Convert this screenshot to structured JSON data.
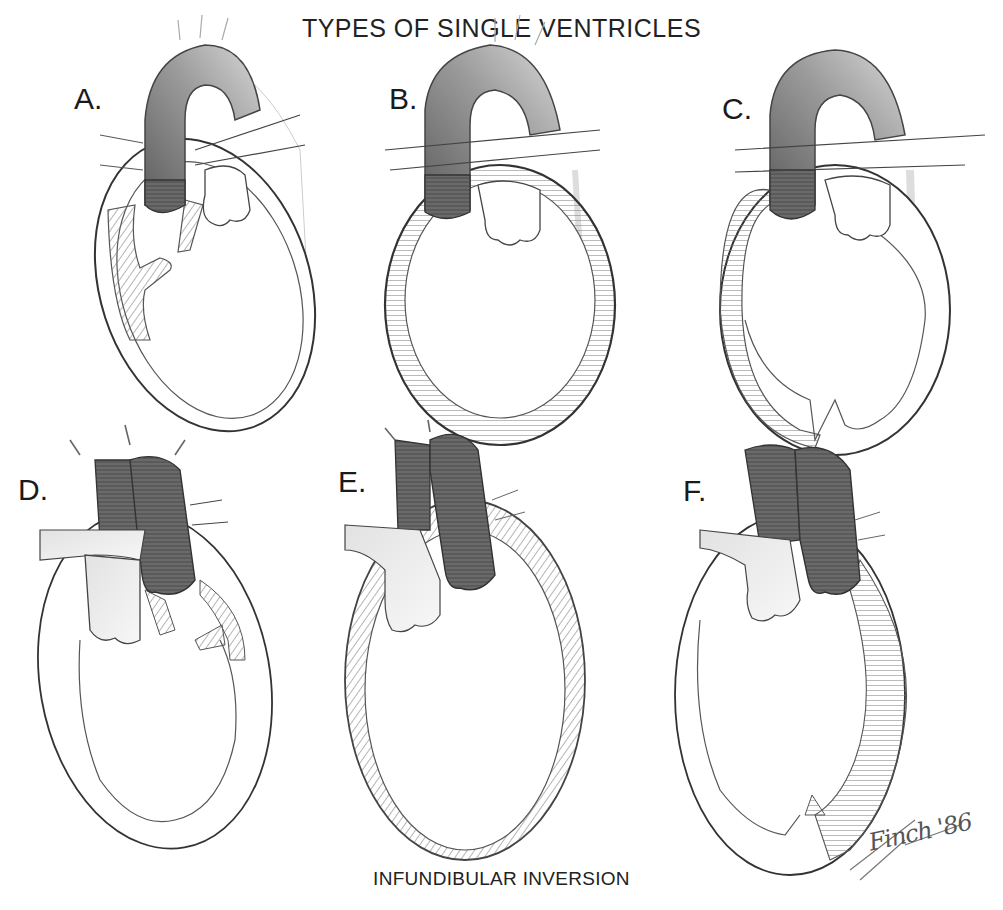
{
  "figure": {
    "title": "TYPES OF SINGLE VENTRICLES",
    "caption": "INFUNDIBULAR INVERSION",
    "signature": "Finch '86",
    "panels": [
      {
        "label": "A.",
        "description": "single ventricle with partial septal remnants"
      },
      {
        "label": "B.",
        "description": "single ventricle with hatched thick wall"
      },
      {
        "label": "C.",
        "description": "single ventricle with apical septal ridge"
      },
      {
        "label": "D.",
        "description": "inverted infundibulum with septal remnants"
      },
      {
        "label": "E.",
        "description": "inverted infundibulum with hatched wall"
      },
      {
        "label": "F.",
        "description": "inverted infundibulum with apical ridge"
      }
    ]
  },
  "colors": {
    "ink": "#222222",
    "vessel_dark": "#5a5a5a",
    "vessel_light": "#b8b8b8",
    "hatch": "#777777",
    "background": "#ffffff"
  }
}
